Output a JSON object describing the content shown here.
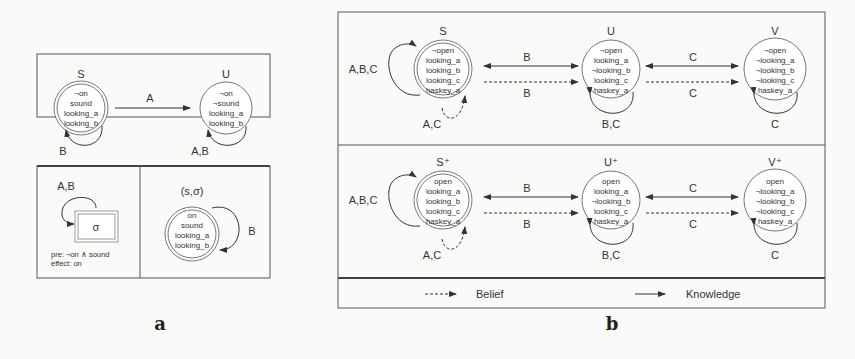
{
  "panel_a": {
    "caption": "a",
    "top": {
      "states": [
        {
          "name": "S",
          "props": [
            "¬on",
            "sound",
            "looking_a",
            "looking_b"
          ],
          "designated": true,
          "self_loop": "B"
        },
        {
          "name": "U",
          "props": [
            "¬on",
            "¬sound",
            "looking_a",
            "looking_b"
          ],
          "designated": false,
          "self_loop": "A,B"
        }
      ],
      "edge_label": "A"
    },
    "action": {
      "name": "σ",
      "self_loop": "A,B",
      "pre": "pre: ¬on ∧ sound",
      "effect": "effect: on"
    },
    "product": {
      "name": "(s,σ)",
      "props": [
        "on",
        "sound",
        "looking_a",
        "looking_b"
      ],
      "self_loop": "B"
    }
  },
  "panel_b": {
    "caption": "b",
    "rows": [
      {
        "states": [
          {
            "name": "S",
            "props": [
              "¬open",
              "looking_a",
              "looking_b",
              "looking_c",
              "haskey_a"
            ],
            "self_loop": "A,B,C",
            "belief_loop": "A,C"
          },
          {
            "name": "U",
            "props": [
              "¬open",
              "looking_a",
              "¬looking_b",
              "looking_c",
              "haskey_a"
            ],
            "self_loop": "B,C"
          },
          {
            "name": "V",
            "props": [
              "¬open",
              "¬looking_a",
              "¬looking_b",
              "¬looking_c",
              "haskey_a"
            ],
            "self_loop": "C"
          }
        ],
        "edges": [
          {
            "knowledge": "B",
            "belief": "B"
          },
          {
            "knowledge": "C",
            "belief": "C"
          }
        ]
      },
      {
        "states": [
          {
            "name": "S⁺",
            "props": [
              "open",
              "looking_a",
              "looking_b",
              "looking_c",
              "haskey_a"
            ],
            "self_loop": "A,B,C",
            "belief_loop": "A,C"
          },
          {
            "name": "U⁺",
            "props": [
              "open",
              "looking_a",
              "¬looking_b",
              "looking_c",
              "haskey_a"
            ],
            "self_loop": "B,C"
          },
          {
            "name": "V⁺",
            "props": [
              "open",
              "¬looking_a",
              "¬looking_b",
              "¬looking_c",
              "haskey_a"
            ],
            "self_loop": "C"
          }
        ],
        "edges": [
          {
            "knowledge": "B",
            "belief": "B"
          },
          {
            "knowledge": "C",
            "belief": "C"
          }
        ]
      }
    ],
    "legend": {
      "belief": "Belief",
      "knowledge": "Knowledge"
    }
  }
}
